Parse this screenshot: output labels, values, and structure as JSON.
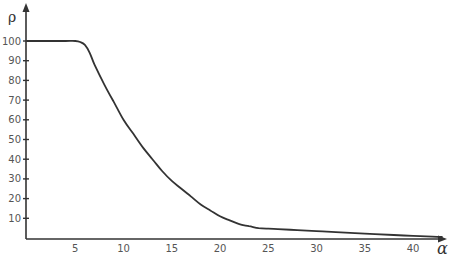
{
  "chart_data": {
    "type": "line",
    "title": "",
    "xlabel": "α",
    "ylabel": "ρ",
    "xlim": [
      0,
      44
    ],
    "ylim": [
      0,
      105
    ],
    "grid": false,
    "legend": null,
    "x_ticks": [
      5,
      10,
      15,
      20,
      25,
      30,
      35,
      40
    ],
    "y_ticks": [
      10,
      20,
      30,
      40,
      50,
      60,
      70,
      80,
      90,
      100
    ],
    "series": [
      {
        "name": "ρ(α)",
        "color": "#333333",
        "x": [
          0,
          2,
          4,
          5,
          5.5,
          6,
          6.5,
          7,
          8,
          9,
          10,
          11,
          12,
          13,
          14,
          15,
          16,
          17,
          18,
          19,
          20,
          21,
          22,
          23,
          24,
          25,
          26,
          28,
          30,
          32,
          35,
          38,
          40,
          42,
          43
        ],
        "y": [
          100,
          100,
          100,
          100,
          99.5,
          98,
          94,
          88,
          78,
          69,
          60,
          53,
          46,
          40,
          34,
          29,
          25,
          21,
          17,
          14,
          11,
          9,
          7,
          6,
          5,
          4.7,
          4.5,
          4,
          3.5,
          3,
          2.2,
          1.5,
          1.1,
          0.7,
          0.5
        ]
      }
    ]
  },
  "axes": {
    "x_label": "α",
    "y_label": "ρ",
    "x_tick_labels": [
      "5",
      "10",
      "15",
      "20",
      "25",
      "30",
      "35",
      "40"
    ],
    "y_tick_labels": [
      "10",
      "20",
      "30",
      "40",
      "50",
      "60",
      "70",
      "80",
      "90",
      "100"
    ]
  }
}
